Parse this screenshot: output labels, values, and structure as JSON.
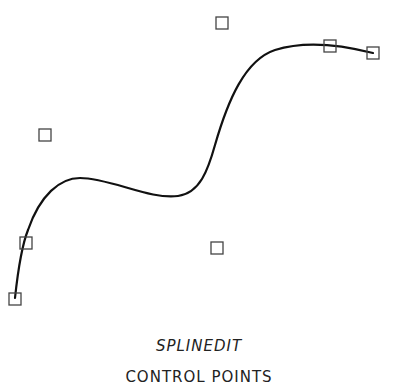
{
  "diagram": {
    "title": "SPLINEDIT",
    "subtitle": "CONTROL POINTS",
    "curve_color": "#111111",
    "marker_color": "#444444",
    "control_points": [
      {
        "x": 15,
        "y": 299
      },
      {
        "x": 26,
        "y": 243
      },
      {
        "x": 45,
        "y": 135
      },
      {
        "x": 217,
        "y": 248
      },
      {
        "x": 222,
        "y": 23
      },
      {
        "x": 330,
        "y": 46
      },
      {
        "x": 373,
        "y": 53
      }
    ]
  }
}
